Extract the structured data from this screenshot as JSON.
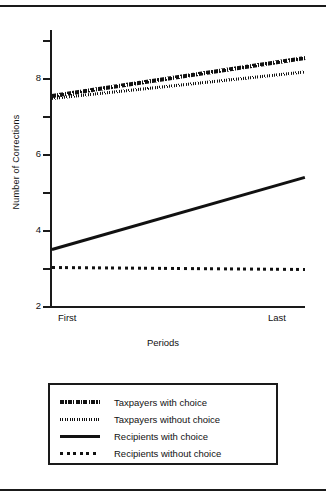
{
  "figure": {
    "xlabel": "Periods",
    "ylabel": "Number of Corrections"
  },
  "chart_data": {
    "type": "line",
    "title": "",
    "xlabel": "Periods",
    "ylabel": "Number of Corrections",
    "categories": [
      "First",
      "Last"
    ],
    "x": [
      0,
      1
    ],
    "xtick_labels": [
      "First",
      "Last"
    ],
    "ylim": [
      2,
      9.3
    ],
    "yticks": [
      2,
      3,
      4,
      5,
      6,
      7,
      8,
      9
    ],
    "ytick_labels": [
      "2",
      "",
      "4",
      "",
      "6",
      "",
      "8",
      ""
    ],
    "grid": false,
    "legend_position": "below-plot",
    "series": [
      {
        "name": "Taxpayers with choice",
        "style": "dash-dot-thick",
        "color": "#111111",
        "values": [
          7.55,
          8.55
        ]
      },
      {
        "name": "Taxpayers without choice",
        "style": "dotted-fine",
        "color": "#111111",
        "values": [
          7.5,
          8.2
        ]
      },
      {
        "name": "Recipients with choice",
        "style": "solid",
        "color": "#111111",
        "values": [
          3.5,
          5.4
        ]
      },
      {
        "name": "Recipients without choice",
        "style": "dotted-coarse",
        "color": "#111111",
        "values": [
          3.05,
          3.0
        ]
      }
    ]
  },
  "axis": {
    "ticks": [
      {
        "value": 9,
        "label": ""
      },
      {
        "value": 8,
        "label": "8"
      },
      {
        "value": 7,
        "label": ""
      },
      {
        "value": 6,
        "label": "6"
      },
      {
        "value": 5,
        "label": ""
      },
      {
        "value": 4,
        "label": "4"
      },
      {
        "value": 3,
        "label": ""
      },
      {
        "value": 2,
        "label": "2"
      }
    ]
  },
  "legend": {
    "entries": [
      {
        "label": "Taxpayers with choice",
        "style": "dash-dot-thick"
      },
      {
        "label": "Taxpayers without choice",
        "style": "dotted-fine"
      },
      {
        "label": "Recipients with choice",
        "style": "solid"
      },
      {
        "label": "Recipients without choice",
        "style": "dotted-coarse"
      }
    ]
  }
}
